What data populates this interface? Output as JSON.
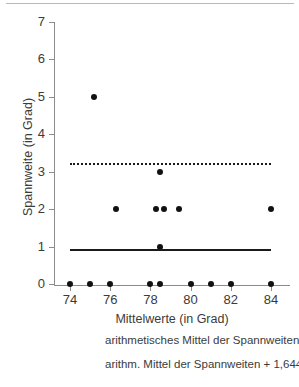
{
  "chart_data": {
    "type": "scatter",
    "title": "",
    "xlabel": "Mittelwerte (in Grad)",
    "ylabel": "Spannweite (in Grad)",
    "xlim": [
      73.2,
      84.9
    ],
    "ylim": [
      0,
      7
    ],
    "xticks": [
      74,
      76,
      78,
      80,
      82,
      84
    ],
    "yticks": [
      0,
      1,
      2,
      3,
      4,
      5,
      6,
      7
    ],
    "grid": false,
    "points": [
      {
        "x": 74.0,
        "y": 0
      },
      {
        "x": 75.0,
        "y": 0
      },
      {
        "x": 76.0,
        "y": 0
      },
      {
        "x": 78.0,
        "y": 0
      },
      {
        "x": 80.0,
        "y": 0
      },
      {
        "x": 81.0,
        "y": 0
      },
      {
        "x": 82.0,
        "y": 0
      },
      {
        "x": 84.0,
        "y": 0
      },
      {
        "x": 78.5,
        "y": 1
      },
      {
        "x": 76.3,
        "y": 2
      },
      {
        "x": 78.3,
        "y": 2
      },
      {
        "x": 78.7,
        "y": 2
      },
      {
        "x": 79.4,
        "y": 2
      },
      {
        "x": 84.0,
        "y": 2
      },
      {
        "x": 78.5,
        "y": 3
      },
      {
        "x": 75.2,
        "y": 5
      },
      {
        "x": 78.5,
        "y": 0
      }
    ],
    "reference_lines": [
      {
        "name": "arithmetisches Mittel der Spannweiten",
        "style": "solid",
        "y": 0.93,
        "x_start": 74.0,
        "x_end": 84.0
      },
      {
        "name": "arithm. Mittel der Spannweiten + 1,6449 x s",
        "style": "dotted",
        "y": 3.22,
        "x_start": 74.0,
        "x_end": 84.0
      }
    ],
    "legend": {
      "position": "below",
      "entries": [
        {
          "label": "arithmetisches Mittel der Spannweiten",
          "style": "solid"
        },
        {
          "label": "arithm. Mittel der Spannweiten + 1,6449 x s",
          "style": "dotted"
        }
      ]
    }
  },
  "colors": {
    "point": "#111111",
    "line": "#1a1a1a",
    "axis": "#8c8c8c",
    "text": "#3b3b3b",
    "rule": "#b8b8b8"
  }
}
